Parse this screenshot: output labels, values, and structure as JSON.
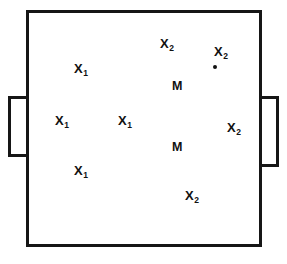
{
  "figure": {
    "type": "schematic-diagram",
    "width": 287,
    "height": 264,
    "background_color": "#ffffff",
    "line_color": "#161616",
    "text_color": "#111111",
    "enclosure": {
      "main_chamber": {
        "x": 26,
        "y": 10,
        "width": 236,
        "height": 237
      },
      "left_flap": {
        "x": 8,
        "y": 96,
        "width": 21,
        "height": 61
      },
      "right_flap": {
        "x": 259,
        "y": 96,
        "width": 20,
        "height": 71
      }
    },
    "labels": [
      {
        "id": "x2-top-left",
        "base": "X",
        "subscript": "2",
        "x": 160,
        "y": 37
      },
      {
        "id": "x2-top-right",
        "base": "X",
        "subscript": "2",
        "x": 214,
        "y": 45
      },
      {
        "id": "x1-upper-left",
        "base": "X",
        "subscript": "1",
        "x": 74,
        "y": 62
      },
      {
        "id": "m-upper",
        "base": "M",
        "subscript": "",
        "x": 172,
        "y": 80
      },
      {
        "id": "x1-mid-left",
        "base": "X",
        "subscript": "1",
        "x": 55,
        "y": 114
      },
      {
        "id": "x1-mid-center",
        "base": "X",
        "subscript": "1",
        "x": 118,
        "y": 114
      },
      {
        "id": "x2-mid-right",
        "base": "X",
        "subscript": "2",
        "x": 227,
        "y": 121
      },
      {
        "id": "m-lower",
        "base": "M",
        "subscript": "",
        "x": 172,
        "y": 141
      },
      {
        "id": "x1-lower-left",
        "base": "X",
        "subscript": "1",
        "x": 74,
        "y": 164
      },
      {
        "id": "x2-bottom",
        "base": "X",
        "subscript": "2",
        "x": 185,
        "y": 189
      }
    ],
    "dots": [
      {
        "id": "dot-top-right",
        "x": 213,
        "y": 65,
        "size": 4
      }
    ]
  }
}
